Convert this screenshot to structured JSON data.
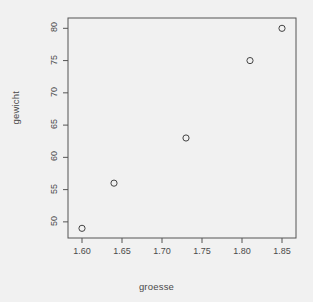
{
  "chart_data": {
    "type": "scatter",
    "title": "",
    "subtitle": "",
    "xlabel": "groesse",
    "ylabel": "gewicht",
    "x": [
      1.6,
      1.64,
      1.73,
      1.81,
      1.85
    ],
    "values": [
      49,
      56,
      63,
      75,
      80
    ],
    "points": [
      {
        "x": 1.6,
        "y": 49
      },
      {
        "x": 1.64,
        "y": 56
      },
      {
        "x": 1.73,
        "y": 63
      },
      {
        "x": 1.81,
        "y": 75
      },
      {
        "x": 1.85,
        "y": 80
      }
    ],
    "xticks": [
      1.6,
      1.65,
      1.7,
      1.75,
      1.8,
      1.85
    ],
    "xtick_labels": [
      "1.60",
      "1.65",
      "1.70",
      "1.75",
      "1.80",
      "1.85"
    ],
    "yticks": [
      50,
      55,
      60,
      65,
      70,
      75,
      80
    ],
    "ytick_labels": [
      "50",
      "55",
      "60",
      "65",
      "70",
      "75",
      "80"
    ],
    "xlim": [
      1.5825,
      1.8675
    ],
    "ylim": [
      47.5,
      81.6
    ],
    "grid": false,
    "legend": null,
    "marker": "open-circle",
    "marker_size": 3.1,
    "colors": {
      "background": "#f1f1f1",
      "axis": "#555555",
      "marker": "#444444",
      "text": "#4a4a4a"
    },
    "plot_area": {
      "left": 68,
      "right": 296,
      "top": 18,
      "bottom": 238
    }
  },
  "axis_titles": {
    "x": "groesse",
    "y": "gewicht"
  }
}
